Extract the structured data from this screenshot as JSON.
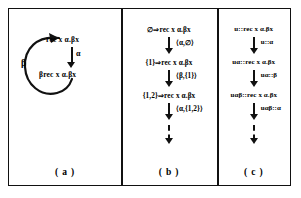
{
  "figure": {
    "panels": [
      {
        "id": "a",
        "label": "( a )",
        "type": "cycle",
        "nodes": [
          "rec x α.βx",
          "βrec x α.βx"
        ],
        "edges": [
          {
            "label": "α",
            "from": "rec x α.βx",
            "to": "βrec x α.βx"
          },
          {
            "label": "β",
            "from": "βrec x α.βx",
            "to": "rec x α.βx"
          }
        ]
      },
      {
        "id": "b",
        "label": "( b )",
        "type": "chain",
        "nodes": [
          "∅⇒rec x α.βx",
          "{1}⇒rec x α.βx",
          "{1,2}⇒rec x α.βx"
        ],
        "edges": [
          {
            "label": "⟨α,∅⟩",
            "style": "solid"
          },
          {
            "label": "⟨β,{1}⟩",
            "style": "solid"
          },
          {
            "label": "⟨α,{1,2}⟩",
            "style": "solid"
          },
          {
            "label": "",
            "style": "dashed"
          }
        ]
      },
      {
        "id": "c",
        "label": "( c )",
        "type": "chain",
        "nodes": [
          "u::rec x α.βx",
          "uα::rec x α.βx",
          "uαβ::rec x α.βx"
        ],
        "edges": [
          {
            "label": "u::α",
            "style": "solid"
          },
          {
            "label": "uα::β",
            "style": "solid"
          },
          {
            "label": "uαβ::α",
            "style": "solid"
          },
          {
            "label": "",
            "style": "dashed"
          }
        ]
      }
    ]
  },
  "colors": {
    "ink": "#111111",
    "background": "#ffffff"
  }
}
